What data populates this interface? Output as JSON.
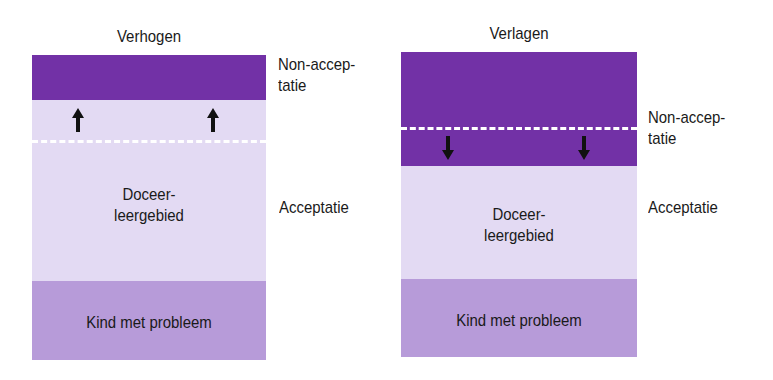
{
  "colors": {
    "non_acceptance": "#7231a6",
    "acceptance": "#e3daf3",
    "problem": "#b79bd9",
    "dashed_line": "#ffffff",
    "text": "#1a1a1a"
  },
  "left_panel": {
    "title": "Verhogen",
    "center_label_line1": "Doceer-",
    "center_label_line2": "leergebied",
    "bottom_label": "Kind met probleem",
    "arrows_direction": "up",
    "side_labels": {
      "non_acceptance_line1": "Non-accep-",
      "non_acceptance_line2": "tatie",
      "acceptance": "Acceptatie"
    }
  },
  "right_panel": {
    "title": "Verlagen",
    "center_label_line1": "Doceer-",
    "center_label_line2": "leergebied",
    "bottom_label": "Kind met probleem",
    "arrows_direction": "down",
    "side_labels": {
      "non_acceptance_line1": "Non-accep-",
      "non_acceptance_line2": "tatie",
      "acceptance": "Acceptatie"
    }
  }
}
